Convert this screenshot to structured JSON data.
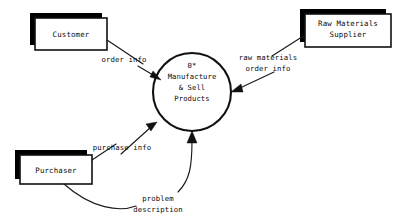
{
  "diagram": {
    "type": "context-data-flow-diagram",
    "canvas": {
      "width": 400,
      "height": 224,
      "background": "#ffffff"
    },
    "ink_color": "#111111",
    "external_entities": [
      {
        "id": "customer",
        "label": "Customer"
      },
      {
        "id": "raw-materials-supplier",
        "label_line1": "Raw Materials",
        "label_line2": "Supplier"
      },
      {
        "id": "purchaser",
        "label": "Purchaser"
      }
    ],
    "process": {
      "id": "manufacture-sell-products",
      "number": "0*",
      "label_line1": "Manufacture",
      "label_line2": "& Sell",
      "label_line3": "Products"
    },
    "data_flows": [
      {
        "id": "order-info",
        "label": "order info",
        "from": "customer",
        "to": "manufacture-sell-products"
      },
      {
        "id": "raw-materials-order-info",
        "label_line1": "raw materials",
        "label_line2": "order info",
        "from": "manufacture-sell-products",
        "to": "raw-materials-supplier"
      },
      {
        "id": "purchase-info",
        "label": "purchase info",
        "from": "purchaser",
        "to": "manufacture-sell-products"
      },
      {
        "id": "problem-description",
        "label_line1": "problem",
        "label_line2": "description",
        "from": "purchaser",
        "to": "manufacture-sell-products"
      }
    ]
  }
}
